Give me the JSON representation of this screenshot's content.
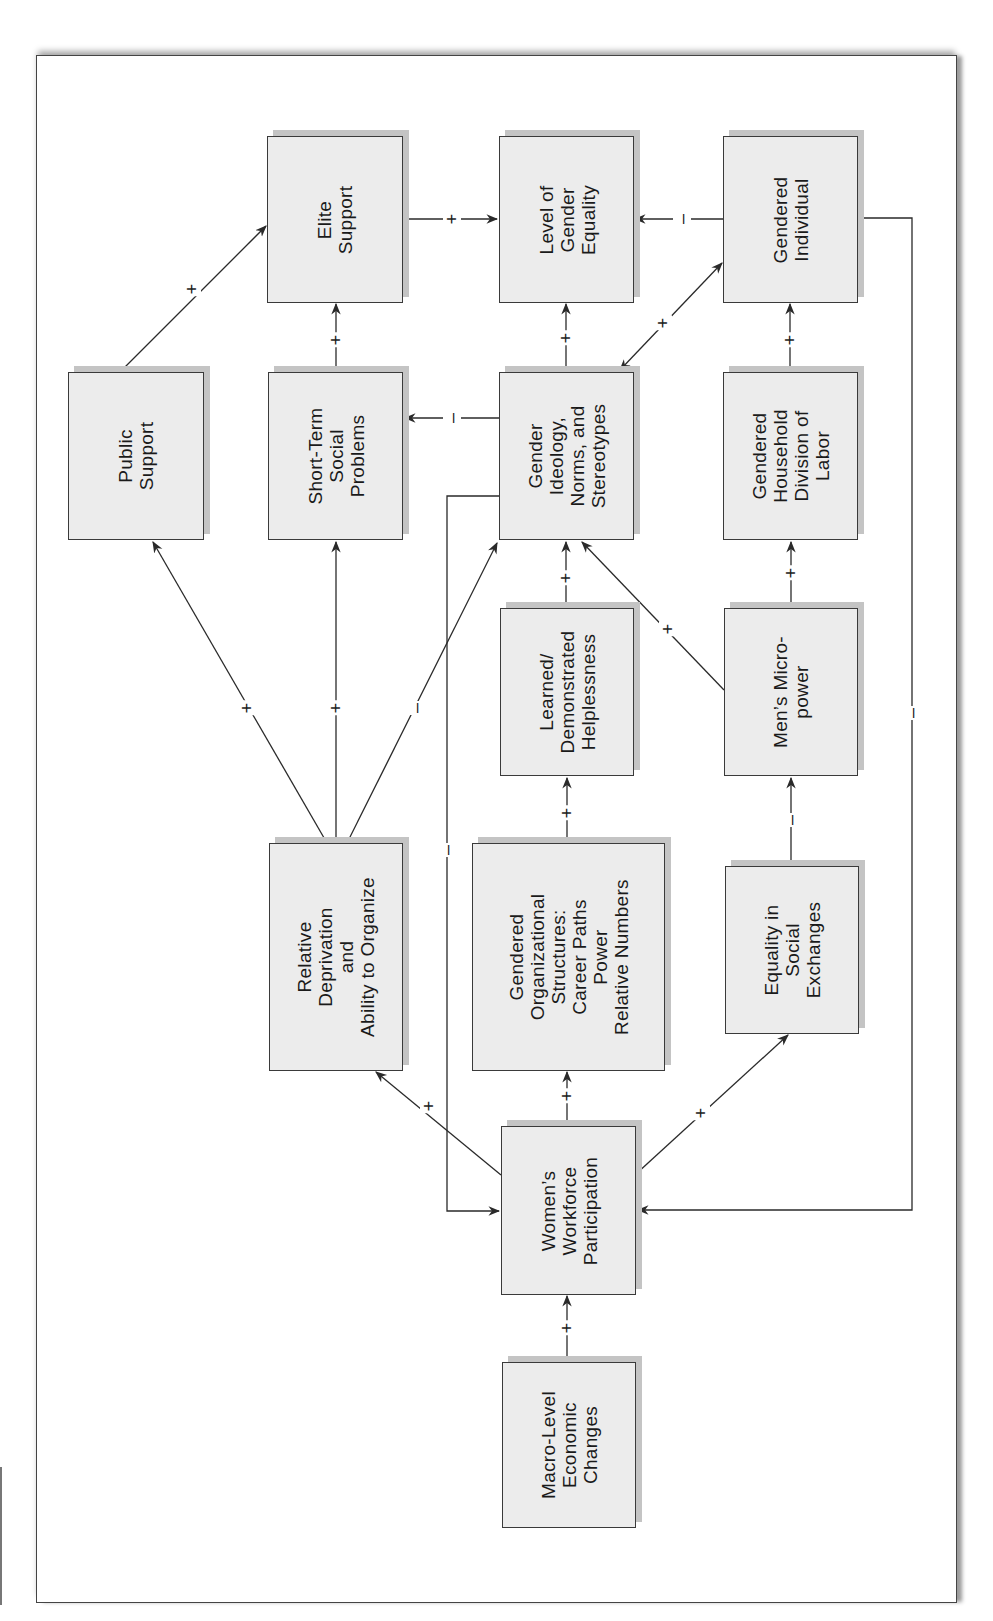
{
  "diagram": {
    "orientation": "rotated-90-ccw",
    "nodes": {
      "elite_support": "Elite\nSupport",
      "level_gender_equality": "Level of\nGender\nEquality",
      "gendered_individual": "Gendered\nIndividual",
      "public_support": "Public\nSupport",
      "short_term_social_problems": "Short-Term\nSocial\nProblems",
      "gender_ideology": "Gender\nIdeology,\nNorms, and\nStereotypes",
      "gendered_household": "Gendered\nHousehold\nDivision of\nLabor",
      "learned_helplessness": "Learned/\nDemonstrated\nHelplessness",
      "mens_micropower": "Men’s Micro-\npower",
      "relative_deprivation": "Relative\nDeprivation\nand\nAbility to Organize",
      "gendered_org_structures": "Gendered\nOrganizational\nStructures:\nCareer Paths\nPower\nRelative Numbers",
      "equality_social_exchanges": "Equality in\nSocial\nExchanges",
      "womens_workforce": "Women’s\nWorkforce\nParticipation",
      "macro_economic": "Macro-Level\nEconomic\nChanges"
    },
    "signs": {
      "public_to_elite": "+",
      "shortterm_to_elite": "+",
      "elite_to_equality": "+",
      "individual_to_equality": "–",
      "ideology_to_equality": "+",
      "ideology_individual": "+",
      "household_to_individual": "+",
      "ideology_to_shortterm": "–",
      "reldep_to_public": "+",
      "reldep_to_shortterm": "+",
      "reldep_to_ideology": "–",
      "learned_to_ideology": "+",
      "micropower_to_ideology": "+",
      "micropower_to_household": "+",
      "org_to_learned": "+",
      "exchanges_to_micropower": "–",
      "ideology_to_workforce": "–",
      "individual_to_workforce": "–",
      "workforce_to_reldep": "+",
      "workforce_to_org": "+",
      "workforce_to_exchanges": "+",
      "macro_to_workforce": "+"
    },
    "edges": [
      {
        "from": "public_support",
        "to": "elite_support",
        "sign": "+"
      },
      {
        "from": "short_term_social_problems",
        "to": "elite_support",
        "sign": "+"
      },
      {
        "from": "elite_support",
        "to": "level_gender_equality",
        "sign": "+"
      },
      {
        "from": "gendered_individual",
        "to": "level_gender_equality",
        "sign": "–"
      },
      {
        "from": "gender_ideology",
        "to": "level_gender_equality",
        "sign": "+"
      },
      {
        "from": "gender_ideology",
        "to": "gendered_individual",
        "sign": "+",
        "bidirectional": true
      },
      {
        "from": "gendered_household",
        "to": "gendered_individual",
        "sign": "+"
      },
      {
        "from": "gender_ideology",
        "to": "short_term_social_problems",
        "sign": "–"
      },
      {
        "from": "relative_deprivation",
        "to": "public_support",
        "sign": "+"
      },
      {
        "from": "relative_deprivation",
        "to": "short_term_social_problems",
        "sign": "+"
      },
      {
        "from": "relative_deprivation",
        "to": "gender_ideology",
        "sign": "–"
      },
      {
        "from": "learned_helplessness",
        "to": "gender_ideology",
        "sign": "+"
      },
      {
        "from": "mens_micropower",
        "to": "gender_ideology",
        "sign": "+"
      },
      {
        "from": "mens_micropower",
        "to": "gendered_household",
        "sign": "+"
      },
      {
        "from": "gendered_org_structures",
        "to": "learned_helplessness",
        "sign": "+"
      },
      {
        "from": "equality_social_exchanges",
        "to": "mens_micropower",
        "sign": "–"
      },
      {
        "from": "gender_ideology",
        "to": "womens_workforce",
        "sign": "–"
      },
      {
        "from": "gendered_individual",
        "to": "womens_workforce",
        "sign": "–"
      },
      {
        "from": "womens_workforce",
        "to": "relative_deprivation",
        "sign": "+"
      },
      {
        "from": "womens_workforce",
        "to": "gendered_org_structures",
        "sign": "+"
      },
      {
        "from": "womens_workforce",
        "to": "equality_social_exchanges",
        "sign": "+"
      },
      {
        "from": "macro_economic",
        "to": "womens_workforce",
        "sign": "+"
      }
    ]
  }
}
